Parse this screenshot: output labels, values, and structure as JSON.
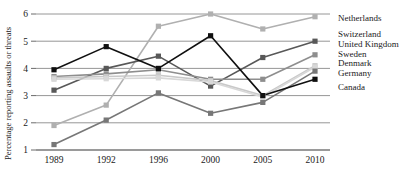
{
  "chart_data": {
    "type": "line",
    "title": "",
    "xlabel": "",
    "ylabel": "Percentage reporting assaults or threats",
    "categories": [
      "1989",
      "1992",
      "1996",
      "2000",
      "2005",
      "2010"
    ],
    "x_tick_labels": [
      "1989",
      "1992",
      "1996",
      "2000",
      "2005",
      "2010"
    ],
    "y_tick_labels": [
      "1",
      "2",
      "3",
      "4",
      "5",
      "6"
    ],
    "ylim": [
      1,
      6
    ],
    "grid": "horizontal",
    "legend_position": "right",
    "series": [
      {
        "name": "Netherlands",
        "color": "#b0b0b0",
        "values": [
          1.9,
          2.65,
          5.55,
          6.0,
          5.45,
          5.9
        ]
      },
      {
        "name": "Switzerland",
        "color": "#585858",
        "values": [
          3.2,
          4.0,
          4.45,
          3.35,
          4.4,
          5.0
        ]
      },
      {
        "name": "United Kingdom",
        "color": "#8e8e8e",
        "values": [
          3.7,
          3.8,
          3.95,
          3.6,
          3.6,
          4.5
        ]
      },
      {
        "name": "Sweden",
        "color": "#c9c9c9",
        "values": [
          3.65,
          3.7,
          3.75,
          3.55,
          3.0,
          4.1
        ]
      },
      {
        "name": "Denmark",
        "color": "#d8d8d8",
        "values": [
          3.6,
          3.62,
          3.65,
          3.5,
          2.95,
          4.05
        ]
      },
      {
        "name": "Germany",
        "color": "#777777",
        "values": [
          1.2,
          2.1,
          3.1,
          2.35,
          2.75,
          3.9
        ]
      },
      {
        "name": "Canada",
        "color": "#101010",
        "values": [
          3.95,
          4.8,
          4.0,
          5.2,
          3.0,
          3.6
        ]
      }
    ],
    "legend_entries": [
      "Netherlands",
      "Switzerland",
      "United Kingdom",
      "Sweden",
      "Denmark",
      "Germany",
      "Canada"
    ]
  }
}
